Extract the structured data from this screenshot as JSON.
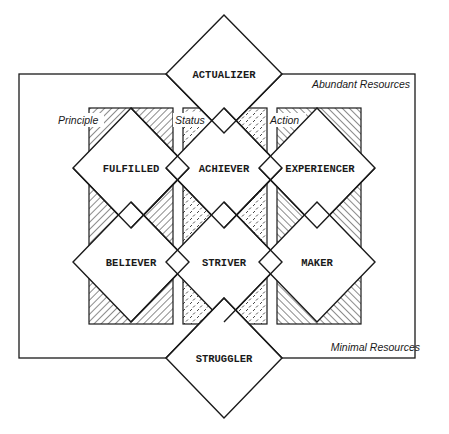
{
  "diagram": {
    "type": "VALS segmentation framework",
    "resource_labels": {
      "top": "Abundant Resources",
      "bottom": "Minimal Resources"
    },
    "orientation_columns": [
      {
        "label": "Principle",
        "pattern": "diagonal-hatch-right"
      },
      {
        "label": "Status",
        "pattern": "dashed-dots"
      },
      {
        "label": "Action",
        "pattern": "diagonal-hatch-left"
      }
    ],
    "segments": {
      "top": "ACTUALIZER",
      "row1": [
        "FULFILLED",
        "ACHIEVER",
        "EXPERIENCER"
      ],
      "row2": [
        "BELIEVER",
        "STRIVER",
        "MAKER"
      ],
      "bottom": "STRUGGLER"
    },
    "colors": {
      "line": "#1a1a1a",
      "background": "#ffffff"
    }
  }
}
